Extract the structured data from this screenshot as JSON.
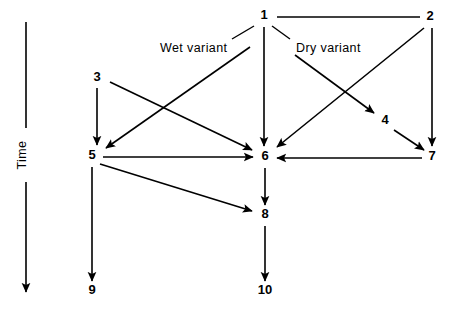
{
  "diagram": {
    "axis": {
      "label": "Time",
      "direction": "downward",
      "arrow_icon": "down-arrow-icon"
    },
    "annotations": [
      {
        "id": "wet",
        "text": "Wet variant"
      },
      {
        "id": "dry",
        "text": "Dry variant"
      }
    ],
    "nodes": [
      {
        "id": "n1",
        "label": "1",
        "x": 264,
        "y": 16
      },
      {
        "id": "n2",
        "label": "2",
        "x": 430,
        "y": 17
      },
      {
        "id": "n3",
        "label": "3",
        "x": 97,
        "y": 78
      },
      {
        "id": "n4",
        "label": "4",
        "x": 385,
        "y": 121
      },
      {
        "id": "n5",
        "label": "5",
        "x": 92,
        "y": 156
      },
      {
        "id": "n6",
        "label": "6",
        "x": 265,
        "y": 157
      },
      {
        "id": "n7",
        "label": "7",
        "x": 432,
        "y": 157
      },
      {
        "id": "n8",
        "label": "8",
        "x": 265,
        "y": 215
      },
      {
        "id": "n9",
        "label": "9",
        "x": 92,
        "y": 291
      },
      {
        "id": "n10",
        "label": "10",
        "x": 265,
        "y": 291
      }
    ],
    "edges": [
      {
        "id": "e1_2",
        "from": "2",
        "to": "1",
        "kind": "plain",
        "note": "horizontal connector, no arrowhead"
      },
      {
        "id": "e1_6",
        "from": "1",
        "to": "6",
        "kind": "arrow"
      },
      {
        "id": "e1_4",
        "from": "1",
        "to": "4",
        "kind": "arrow"
      },
      {
        "id": "e2_6",
        "from": "2",
        "to": "6",
        "kind": "arrow"
      },
      {
        "id": "e2_7",
        "from": "2",
        "to": "7",
        "kind": "arrow"
      },
      {
        "id": "e3_5",
        "from": "3",
        "to": "5",
        "kind": "arrow"
      },
      {
        "id": "e3_6",
        "from": "3",
        "to": "6",
        "kind": "arrow"
      },
      {
        "id": "e1_5",
        "from": "1",
        "to": "5",
        "kind": "arrow"
      },
      {
        "id": "e4_7",
        "from": "4",
        "to": "7",
        "kind": "arrow"
      },
      {
        "id": "e5_6",
        "from": "5",
        "to": "6",
        "kind": "arrow"
      },
      {
        "id": "e7_6",
        "from": "7",
        "to": "6",
        "kind": "arrow"
      },
      {
        "id": "e5_8",
        "from": "5",
        "to": "8",
        "kind": "arrow"
      },
      {
        "id": "e6_8",
        "from": "6",
        "to": "8",
        "kind": "arrow"
      },
      {
        "id": "e5_9",
        "from": "5",
        "to": "9",
        "kind": "arrow"
      },
      {
        "id": "e8_10",
        "from": "8",
        "to": "10",
        "kind": "arrow"
      }
    ],
    "colors": {
      "stroke": "#000000",
      "background": "#ffffff",
      "text": "#000000"
    }
  }
}
